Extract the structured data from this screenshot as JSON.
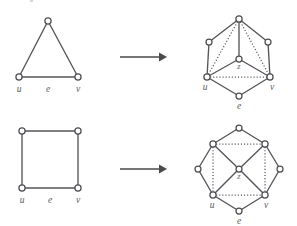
{
  "figure": {
    "kind": "diagram",
    "background_color": "#ffffff",
    "stroke_color": "#55555a",
    "node_fill_color": "#ffffff",
    "label_color": "#5b5b5b"
  },
  "rows": [
    {
      "id": "row-1",
      "name": "triangle-to-hexagon",
      "source": {
        "name": "triangle-graph",
        "shape": "triangle",
        "vertex_count": 3,
        "edge_count": 3,
        "labels": {
          "u": "u",
          "e": "e",
          "v": "v"
        },
        "nodes": [
          {
            "id": "apex",
            "x": 48,
            "y": 21,
            "label": ""
          },
          {
            "id": "u",
            "x": 19,
            "y": 77,
            "label": "u"
          },
          {
            "id": "v",
            "x": 78,
            "y": 77,
            "label": "v"
          }
        ],
        "edges": [
          {
            "from": "apex",
            "to": "u",
            "style": "solid"
          },
          {
            "from": "apex",
            "to": "v",
            "style": "solid"
          },
          {
            "from": "u",
            "to": "v",
            "style": "solid",
            "label": "e"
          }
        ],
        "edge_label": {
          "text": "e",
          "x": 48,
          "y": 90
        }
      },
      "arrow": {
        "name": "maps-to-arrow",
        "x1": 120,
        "x2": 163,
        "y": 57,
        "direction": "right"
      },
      "target": {
        "name": "hexagon-graph",
        "shape": "hexagon",
        "vertex_count": 7,
        "center_label": "z",
        "labels": {
          "u": "u",
          "e": "e",
          "v": "v",
          "z": "z"
        },
        "nodes": [
          {
            "id": "top",
            "x": 239,
            "y": 19,
            "label": ""
          },
          {
            "id": "upper_left",
            "x": 209,
            "y": 42,
            "label": ""
          },
          {
            "id": "upper_right",
            "x": 268,
            "y": 42,
            "label": ""
          },
          {
            "id": "u",
            "x": 207,
            "y": 77,
            "label": "u"
          },
          {
            "id": "v",
            "x": 270,
            "y": 77,
            "label": "v"
          },
          {
            "id": "bottom",
            "x": 239,
            "y": 96,
            "label": "e"
          },
          {
            "id": "z",
            "x": 239,
            "y": 59,
            "label": "z"
          }
        ],
        "edges": [
          {
            "from": "top",
            "to": "upper_left",
            "style": "solid"
          },
          {
            "from": "top",
            "to": "upper_right",
            "style": "solid"
          },
          {
            "from": "upper_left",
            "to": "u",
            "style": "solid"
          },
          {
            "from": "upper_right",
            "to": "v",
            "style": "solid"
          },
          {
            "from": "u",
            "to": "bottom",
            "style": "solid"
          },
          {
            "from": "v",
            "to": "bottom",
            "style": "solid"
          },
          {
            "from": "top",
            "to": "z",
            "style": "solid"
          },
          {
            "from": "z",
            "to": "u",
            "style": "solid"
          },
          {
            "from": "z",
            "to": "v",
            "style": "solid"
          },
          {
            "from": "top",
            "to": "u",
            "style": "dotted"
          },
          {
            "from": "top",
            "to": "v",
            "style": "dotted"
          },
          {
            "from": "u",
            "to": "v",
            "style": "dotted"
          }
        ]
      }
    },
    {
      "id": "row-2",
      "name": "square-to-octagon",
      "source": {
        "name": "square-graph",
        "shape": "square",
        "vertex_count": 4,
        "edge_count": 4,
        "labels": {
          "u": "u",
          "e": "e",
          "v": "v"
        },
        "nodes": [
          {
            "id": "top_left",
            "x": 22,
            "y": 18,
            "label": ""
          },
          {
            "id": "top_right",
            "x": 78,
            "y": 18,
            "label": ""
          },
          {
            "id": "u",
            "x": 22,
            "y": 75,
            "label": "u"
          },
          {
            "id": "v",
            "x": 78,
            "y": 75,
            "label": "v"
          }
        ],
        "edges": [
          {
            "from": "top_left",
            "to": "top_right",
            "style": "solid"
          },
          {
            "from": "top_left",
            "to": "u",
            "style": "solid"
          },
          {
            "from": "top_right",
            "to": "v",
            "style": "solid"
          },
          {
            "from": "u",
            "to": "v",
            "style": "solid",
            "label": "e"
          }
        ],
        "edge_label": {
          "text": "e",
          "x": 50,
          "y": 89
        }
      },
      "arrow": {
        "name": "maps-to-arrow",
        "x1": 120,
        "x2": 163,
        "y": 56,
        "direction": "right"
      },
      "target": {
        "name": "octagon-graph",
        "shape": "octagon",
        "vertex_count": 9,
        "center_label": "z",
        "labels": {
          "u": "u",
          "e": "e",
          "v": "v",
          "z": "z"
        },
        "nodes": [
          {
            "id": "top",
            "x": 239,
            "y": 15,
            "label": ""
          },
          {
            "id": "top_left",
            "x": 213,
            "y": 31,
            "label": ""
          },
          {
            "id": "top_right",
            "x": 265,
            "y": 31,
            "label": ""
          },
          {
            "id": "left",
            "x": 198,
            "y": 56,
            "label": ""
          },
          {
            "id": "right",
            "x": 280,
            "y": 56,
            "label": ""
          },
          {
            "id": "u",
            "x": 213,
            "y": 82,
            "label": "u"
          },
          {
            "id": "v",
            "x": 265,
            "y": 82,
            "label": "v"
          },
          {
            "id": "bottom",
            "x": 239,
            "y": 98,
            "label": "e"
          },
          {
            "id": "z",
            "x": 239,
            "y": 56,
            "label": "z"
          }
        ],
        "edges": [
          {
            "from": "top",
            "to": "top_left",
            "style": "solid"
          },
          {
            "from": "top",
            "to": "top_right",
            "style": "solid"
          },
          {
            "from": "top_left",
            "to": "left",
            "style": "solid"
          },
          {
            "from": "top_right",
            "to": "right",
            "style": "solid"
          },
          {
            "from": "left",
            "to": "u",
            "style": "solid"
          },
          {
            "from": "right",
            "to": "v",
            "style": "solid"
          },
          {
            "from": "u",
            "to": "bottom",
            "style": "solid"
          },
          {
            "from": "v",
            "to": "bottom",
            "style": "solid"
          },
          {
            "from": "z",
            "to": "top_left",
            "style": "solid"
          },
          {
            "from": "z",
            "to": "top_right",
            "style": "solid"
          },
          {
            "from": "z",
            "to": "u",
            "style": "solid"
          },
          {
            "from": "z",
            "to": "v",
            "style": "solid"
          },
          {
            "from": "top_left",
            "to": "top_right",
            "style": "dotted"
          },
          {
            "from": "top_left",
            "to": "u",
            "style": "dotted"
          },
          {
            "from": "top_right",
            "to": "v",
            "style": "dotted"
          },
          {
            "from": "u",
            "to": "v",
            "style": "dotted"
          }
        ]
      }
    }
  ]
}
